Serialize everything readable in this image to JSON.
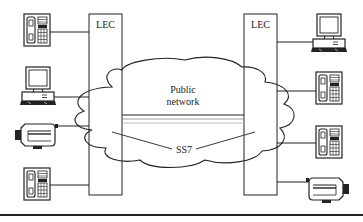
{
  "diagram": {
    "type": "network",
    "left_exchange": {
      "label": "LEC"
    },
    "right_exchange": {
      "label": "LEC"
    },
    "network": {
      "line1": "Public",
      "line2": "network"
    },
    "signaling": {
      "label": "SS7"
    },
    "left_devices": [
      "telephone",
      "computer",
      "fax-machine",
      "telephone"
    ],
    "right_devices": [
      "computer",
      "telephone",
      "telephone",
      "fax-machine"
    ],
    "colors": {
      "stroke": "#222222",
      "background": "#ffffff",
      "trunk": "#888888"
    }
  }
}
